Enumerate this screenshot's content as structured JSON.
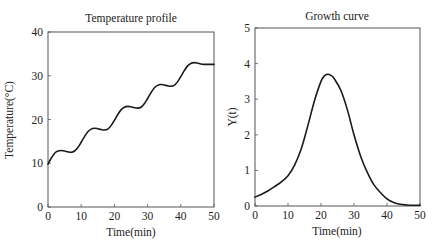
{
  "chart_data": [
    {
      "type": "line",
      "title": "Temperature profile",
      "xlabel": "Time(min)",
      "ylabel": "Temperature(°C)",
      "xlim": [
        0,
        50
      ],
      "ylim": [
        0,
        40
      ],
      "xticks": [
        0,
        10,
        20,
        30,
        40,
        50
      ],
      "yticks": [
        0,
        10,
        20,
        30,
        40
      ],
      "grid": false,
      "legend": null,
      "series": [
        {
          "name": "Temperature",
          "x": [
            0,
            1,
            2,
            3,
            4,
            5,
            6,
            7,
            8,
            9,
            10,
            11,
            12,
            13,
            14,
            15,
            16,
            17,
            18,
            19,
            20,
            21,
            22,
            23,
            24,
            25,
            26,
            27,
            28,
            29,
            30,
            31,
            32,
            33,
            34,
            35,
            36,
            37,
            38,
            39,
            40,
            41,
            42,
            43,
            44,
            45,
            46,
            47,
            48,
            49,
            50
          ],
          "y": [
            9.8,
            11.2,
            12.3,
            12.8,
            12.9,
            12.8,
            12.6,
            12.5,
            12.8,
            13.6,
            14.8,
            16.1,
            17.2,
            17.8,
            18.0,
            17.9,
            17.7,
            17.6,
            17.8,
            18.6,
            19.8,
            21.1,
            22.2,
            22.8,
            23.0,
            22.9,
            22.7,
            22.6,
            22.8,
            23.6,
            24.8,
            26.1,
            27.2,
            27.8,
            28.0,
            27.9,
            27.7,
            27.6,
            27.8,
            28.6,
            29.8,
            31.1,
            32.2,
            32.8,
            33.0,
            32.9,
            32.7,
            32.6,
            32.6,
            32.6,
            32.6
          ]
        }
      ]
    },
    {
      "type": "line",
      "title": "Growth curve",
      "xlabel": "Time(min)",
      "ylabel": "Y(t)",
      "xlim": [
        0,
        50
      ],
      "ylim": [
        0,
        5
      ],
      "xticks": [
        0,
        10,
        20,
        30,
        40,
        50
      ],
      "yticks": [
        0,
        1,
        2,
        3,
        4,
        5
      ],
      "grid": false,
      "legend": null,
      "series": [
        {
          "name": "Y(t)",
          "x": [
            0,
            2,
            4,
            6,
            8,
            10,
            12,
            14,
            16,
            18,
            20,
            21,
            22,
            23,
            24,
            26,
            28,
            30,
            32,
            34,
            36,
            38,
            40,
            42,
            44,
            46,
            48,
            50
          ],
          "y": [
            0.25,
            0.33,
            0.43,
            0.55,
            0.68,
            0.85,
            1.15,
            1.6,
            2.25,
            2.95,
            3.5,
            3.65,
            3.7,
            3.67,
            3.58,
            3.25,
            2.7,
            2.0,
            1.4,
            0.95,
            0.6,
            0.38,
            0.2,
            0.1,
            0.05,
            0.03,
            0.02,
            0.02
          ]
        }
      ]
    }
  ],
  "panels": {
    "left": {
      "title": "Temperature profile",
      "xlabel": "Time(min)",
      "ylabel": "Temperature(°C)",
      "xtick_labels": [
        "0",
        "10",
        "20",
        "30",
        "40",
        "50"
      ],
      "ytick_labels": [
        "0",
        "10",
        "20",
        "30",
        "40"
      ]
    },
    "right": {
      "title": "Growth curve",
      "xlabel": "Time(min)",
      "ylabel": "Y(t)",
      "xtick_labels": [
        "0",
        "10",
        "20",
        "30",
        "40",
        "50"
      ],
      "ytick_labels": [
        "0",
        "1",
        "2",
        "3",
        "4",
        "5"
      ]
    }
  },
  "colors": {
    "line": "#1a1a1a",
    "axes": "#555555",
    "text": "#222222",
    "background": "#ffffff"
  }
}
